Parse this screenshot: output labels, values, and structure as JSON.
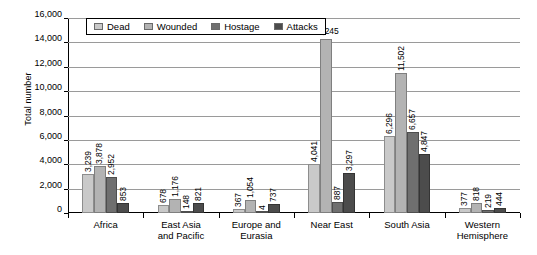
{
  "chart_data": {
    "type": "bar",
    "title": "",
    "xlabel": "",
    "ylabel": "Total number",
    "ylim": [
      0,
      16000
    ],
    "ytick_step": 2000,
    "ytick_labels": [
      "0",
      "2,000",
      "4,000",
      "6,000",
      "8,000",
      "10,000",
      "12,000",
      "14,000",
      "16,000"
    ],
    "grid": true,
    "legend_position": "top-left-inside",
    "categories": [
      "Africa",
      "East Asia and Pacific",
      "Europe and Eurasia",
      "Near East",
      "South Asia",
      "Western Hemisphere"
    ],
    "category_lines": [
      [
        "Africa"
      ],
      [
        "East Asia",
        "and Pacific"
      ],
      [
        "Europe and",
        "Eurasia"
      ],
      [
        "Near East"
      ],
      [
        "South Asia"
      ],
      [
        "Western",
        "Hemisphere"
      ]
    ],
    "series": [
      {
        "name": "Dead",
        "color": "#c9c9c9",
        "values": [
          3239,
          678,
          367,
          4041,
          6296,
          377
        ],
        "labels": [
          "3,239",
          "678",
          "367",
          "4,041",
          "6,296",
          "377"
        ]
      },
      {
        "name": "Wounded",
        "color": "#b3b3b3",
        "values": [
          3878,
          1176,
          1054,
          14245,
          11502,
          818
        ],
        "labels": [
          "3,878",
          "1,176",
          "1,054",
          "14,245",
          "11,502",
          "818"
        ]
      },
      {
        "name": "Hostage",
        "color": "#6f6f6f",
        "values": [
          2952,
          148,
          4,
          887,
          6657,
          219
        ],
        "labels": [
          "2,952",
          "148",
          "4",
          "887",
          "6,657",
          "219"
        ]
      },
      {
        "name": "Attacks",
        "color": "#4c4c4c",
        "values": [
          853,
          821,
          737,
          3297,
          4847,
          444
        ],
        "labels": [
          "853",
          "821",
          "737",
          "3,297",
          "4,847",
          "444"
        ]
      }
    ]
  }
}
